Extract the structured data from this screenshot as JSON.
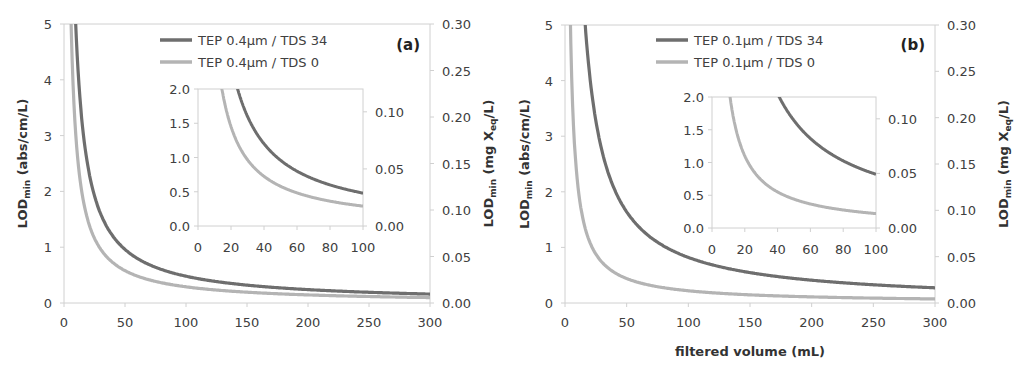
{
  "colors": {
    "dark_series": "#6e6e6e",
    "light_series": "#b4b4b4",
    "axis": "#d0d0d0",
    "text": "#404040"
  },
  "chart_data": [
    {
      "type": "line",
      "panel_label": "(a)",
      "title": "",
      "xlabel": "",
      "ylabel": "LOD_min (abs/cm/L)",
      "ylabel_parts": {
        "main": "LOD",
        "sub": "min",
        "rest": " (abs/cm/L)"
      },
      "y2label": "LOD_min (mg X_eq/L)",
      "y2label_parts": {
        "main": "LOD",
        "sub": "min",
        "mid": " (mg X",
        "sub2": "eq",
        "rest": "/L)"
      },
      "xlim": [
        0,
        300
      ],
      "ylim": [
        0,
        5
      ],
      "y2lim": [
        0,
        0.3
      ],
      "xticks": [
        "0",
        "50",
        "100",
        "150",
        "200",
        "250",
        "300"
      ],
      "yticks": [
        "0",
        "1",
        "2",
        "3",
        "4",
        "5"
      ],
      "y2ticks": [
        "0.00",
        "0.05",
        "0.10",
        "0.15",
        "0.20",
        "0.25",
        "0.30"
      ],
      "legend": [
        "TEP 0.4µm / TDS 34",
        "TEP 0.4µm / TDS 0"
      ],
      "series": [
        {
          "name": "TEP 0.4µm / TDS 34",
          "model": "k/x",
          "k": 48,
          "x": [
            10,
            20,
            25,
            50,
            100,
            150,
            200,
            250,
            300
          ],
          "values": [
            4.8,
            2.4,
            1.92,
            0.96,
            0.48,
            0.32,
            0.24,
            0.19,
            0.16
          ]
        },
        {
          "name": "TEP 0.4µm / TDS 0",
          "model": "k/x",
          "k": 29,
          "x": [
            6,
            10,
            15,
            20,
            50,
            100,
            150,
            200,
            250,
            300
          ],
          "values": [
            4.83,
            2.9,
            1.93,
            1.45,
            0.58,
            0.29,
            0.19,
            0.15,
            0.12,
            0.1
          ]
        }
      ],
      "inset": {
        "xlim": [
          0,
          100
        ],
        "ylim": [
          0,
          2.0
        ],
        "y2lim": [
          0,
          0.12
        ],
        "xticks": [
          "0",
          "20",
          "40",
          "60",
          "80",
          "100"
        ],
        "yticks": [
          "0.0",
          "0.5",
          "1.0",
          "1.5",
          "2.0"
        ],
        "y2ticks": [
          "0.00",
          "0.05",
          "0.10"
        ]
      },
      "grid": false,
      "legend_position": "upper right"
    },
    {
      "type": "line",
      "panel_label": "(b)",
      "title": "",
      "xlabel": "filtered volume (mL)",
      "ylabel": "LOD_min (abs/cm/L)",
      "ylabel_parts": {
        "main": "LOD",
        "sub": "min",
        "rest": " (abs/cm/L)"
      },
      "y2label": "LOD_min (mg X_eq/L)",
      "y2label_parts": {
        "main": "LOD",
        "sub": "min",
        "mid": " (mg X",
        "sub2": "eq",
        "rest": "/L)"
      },
      "xlim": [
        0,
        300
      ],
      "ylim": [
        0,
        5
      ],
      "y2lim": [
        0,
        0.3
      ],
      "xticks": [
        "0",
        "50",
        "100",
        "150",
        "200",
        "250",
        "300"
      ],
      "yticks": [
        "0",
        "1",
        "2",
        "3",
        "4",
        "5"
      ],
      "y2ticks": [
        "0.00",
        "0.05",
        "0.10",
        "0.15",
        "0.20",
        "0.25",
        "0.30"
      ],
      "legend": [
        "TEP 0.1µm / TDS 34",
        "TEP 0.1µm / TDS 0"
      ],
      "series": [
        {
          "name": "TEP 0.1µm / TDS 34",
          "model": "k/x",
          "k": 82,
          "x": [
            17,
            20,
            41,
            50,
            100,
            150,
            200,
            250,
            300
          ],
          "values": [
            4.82,
            4.1,
            2.0,
            1.64,
            0.82,
            0.55,
            0.41,
            0.33,
            0.27
          ]
        },
        {
          "name": "TEP 0.1µm / TDS 0",
          "model": "k/x",
          "k": 22,
          "x": [
            5,
            11,
            20,
            50,
            100,
            150,
            200,
            250,
            300
          ],
          "values": [
            4.4,
            2.0,
            1.1,
            0.44,
            0.22,
            0.15,
            0.11,
            0.09,
            0.07
          ]
        }
      ],
      "inset": {
        "xlim": [
          0,
          100
        ],
        "ylim": [
          0,
          2.0
        ],
        "y2lim": [
          0,
          0.12
        ],
        "xticks": [
          "0",
          "20",
          "40",
          "60",
          "80",
          "100"
        ],
        "yticks": [
          "0.0",
          "0.5",
          "1.0",
          "1.5",
          "2.0"
        ],
        "y2ticks": [
          "0.00",
          "0.05",
          "0.10"
        ]
      },
      "grid": false,
      "legend_position": "upper right"
    }
  ]
}
